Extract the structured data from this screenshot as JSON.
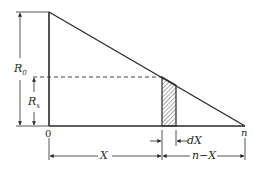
{
  "diagram": {
    "type": "triangle-distribution",
    "colors": {
      "stroke": "#2a2a2a",
      "background": "#ffffff"
    },
    "labels": {
      "r0": "R",
      "r0_sub": "0",
      "rx": "R",
      "rx_sub": "x",
      "origin": "0",
      "n": "n",
      "x": "X",
      "dx": "dX",
      "n_minus_x": "n−X"
    },
    "elements": {
      "triangle": {
        "vertices": [
          [
            49,
            12
          ],
          [
            49,
            126
          ],
          [
            245,
            126
          ]
        ]
      },
      "dashed_level": {
        "y": 77
      },
      "strip": {
        "x_start": 162,
        "x_end": 176,
        "pattern": "hatched"
      }
    }
  }
}
